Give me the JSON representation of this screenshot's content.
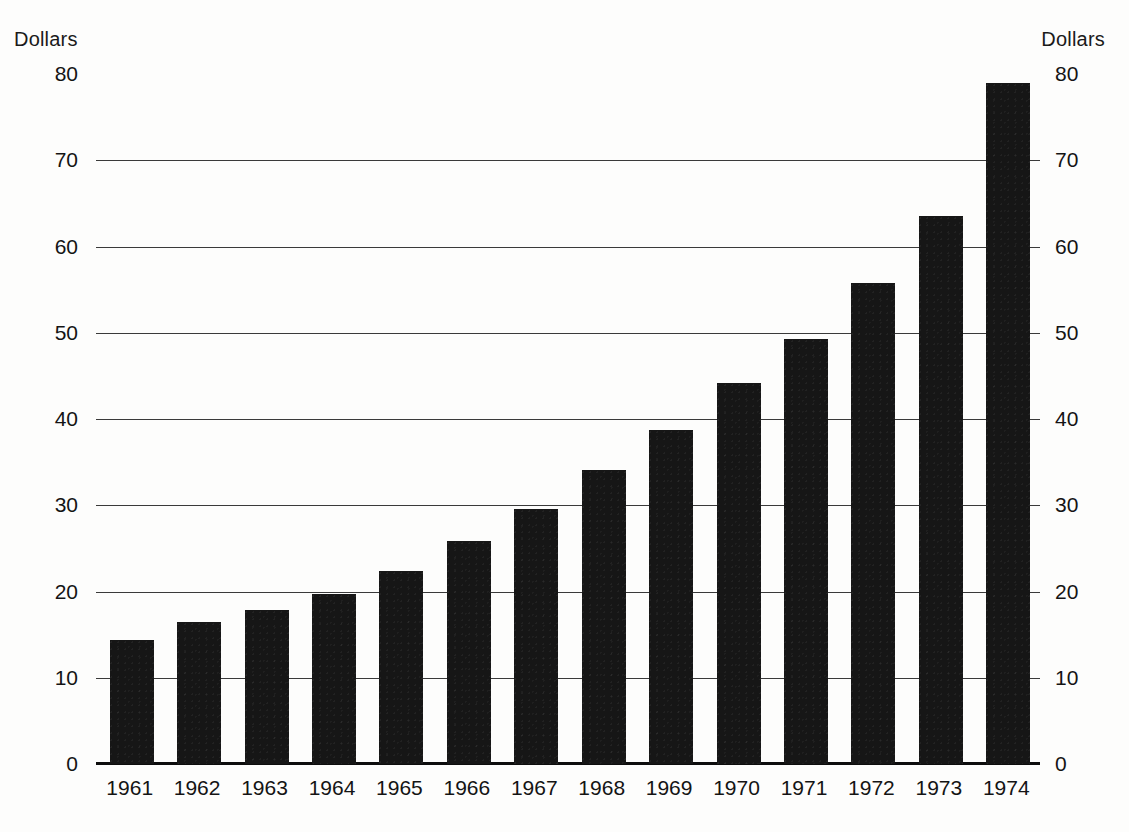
{
  "axes": {
    "unit_label_left": "Dollars",
    "unit_label_right": "Dollars",
    "y_ticks": [
      "0",
      "10",
      "20",
      "30",
      "40",
      "50",
      "60",
      "70",
      "80"
    ]
  },
  "colors": {
    "bar": "#161616",
    "gridline": "#3a3a3a",
    "axis": "#0d0d0d",
    "background": "#fdfdfc",
    "text": "#141414"
  },
  "chart_data": {
    "type": "bar",
    "title": "",
    "subtitle": "",
    "xlabel": "",
    "ylabel": "Dollars",
    "ylabel_right": "Dollars",
    "ylim": [
      0,
      80
    ],
    "ytick_step": 10,
    "yticks": [
      0,
      10,
      20,
      30,
      40,
      50,
      60,
      70,
      80
    ],
    "grid": true,
    "legend": false,
    "categories": [
      "1961",
      "1962",
      "1963",
      "1964",
      "1965",
      "1966",
      "1967",
      "1968",
      "1969",
      "1970",
      "1971",
      "1972",
      "1973",
      "1974"
    ],
    "values": [
      14.4,
      16.5,
      17.8,
      19.7,
      22.4,
      25.8,
      29.6,
      34.1,
      38.7,
      44.2,
      49.3,
      55.8,
      63.5,
      79.0
    ],
    "series": [
      {
        "name": "Dollars",
        "values": [
          14.4,
          16.5,
          17.8,
          19.7,
          22.4,
          25.8,
          29.6,
          34.1,
          38.7,
          44.2,
          49.3,
          55.8,
          63.5,
          79.0
        ]
      }
    ]
  }
}
